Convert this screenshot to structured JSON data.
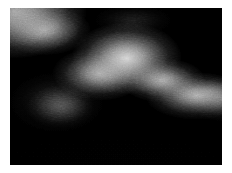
{
  "figure": {
    "canvas_width_px": 232,
    "canvas_height_px": 173,
    "margin_px": {
      "left": 10,
      "top": 8,
      "right": 10,
      "bottom": 8
    },
    "plot_width_px": 212,
    "plot_height_px": 157,
    "background_color": "#ffffff",
    "field_background_color": "#000000",
    "peak_color": "#dcdcdc",
    "midtone_color": "#8a8a8a",
    "shadow_color": "#050505",
    "colormap": "grayscale",
    "render_style": "dithered-halftone",
    "grain_opacity": 0.3
  },
  "chart_data": {
    "type": "heatmap",
    "subtitle": "",
    "xlabel": "",
    "ylabel": "",
    "xlim": [
      0,
      212
    ],
    "ylim": [
      0,
      157
    ],
    "grid": false,
    "legend": false,
    "colorbar": false,
    "xticklabels": [],
    "yticklabels": [],
    "value_range": [
      0,
      220
    ],
    "colormap": "gray",
    "features": [
      {
        "name": "upper-left-streak",
        "cx_pct": 2,
        "cy_pct": 2,
        "rx_pct": 34,
        "ry_pct": 30,
        "peak_value": 220,
        "rotation_deg": -30
      },
      {
        "name": "upper-left-streak-tail",
        "cx_pct": 16,
        "cy_pct": 14,
        "rx_pct": 22,
        "ry_pct": 16,
        "peak_value": 175,
        "rotation_deg": -35
      },
      {
        "name": "central-dome",
        "cx_pct": 55,
        "cy_pct": 32,
        "rx_pct": 26,
        "ry_pct": 23,
        "peak_value": 215,
        "rotation_deg": 0
      },
      {
        "name": "central-dome-shoulder",
        "cx_pct": 42,
        "cy_pct": 42,
        "rx_pct": 22,
        "ry_pct": 17,
        "peak_value": 185,
        "rotation_deg": -10
      },
      {
        "name": "right-band",
        "cx_pct": 88,
        "cy_pct": 56,
        "rx_pct": 24,
        "ry_pct": 15,
        "peak_value": 200,
        "rotation_deg": 12
      },
      {
        "name": "right-band-link",
        "cx_pct": 72,
        "cy_pct": 46,
        "rx_pct": 20,
        "ry_pct": 14,
        "peak_value": 190,
        "rotation_deg": 20
      },
      {
        "name": "lower-left-blob",
        "cx_pct": 24,
        "cy_pct": 63,
        "rx_pct": 16,
        "ry_pct": 14,
        "peak_value": 135,
        "rotation_deg": 0
      },
      {
        "name": "lower-left-blob-halo",
        "cx_pct": 22,
        "cy_pct": 60,
        "rx_pct": 22,
        "ry_pct": 19,
        "peak_value": 80,
        "rotation_deg": -12
      },
      {
        "name": "right-edge-glow",
        "cx_pct": 100,
        "cy_pct": 58,
        "rx_pct": 16,
        "ry_pct": 14,
        "peak_value": 165,
        "rotation_deg": 0
      },
      {
        "name": "top-center-haze",
        "cx_pct": 58,
        "cy_pct": 8,
        "rx_pct": 18,
        "ry_pct": 10,
        "peak_value": 70,
        "rotation_deg": 0
      },
      {
        "name": "bottom-field",
        "cx_pct": 50,
        "cy_pct": 100,
        "rx_pct": 60,
        "ry_pct": 20,
        "peak_value": 8,
        "rotation_deg": 0
      }
    ],
    "regions": [
      {
        "name": "dark-valley-between-blobs",
        "cx_pct": 37,
        "cy_pct": 55,
        "value": 6
      },
      {
        "name": "dark-lower-half",
        "cx_pct": 50,
        "cy_pct": 88,
        "value": 3
      },
      {
        "name": "dark-upper-right",
        "cx_pct": 85,
        "cy_pct": 10,
        "value": 4
      }
    ]
  }
}
